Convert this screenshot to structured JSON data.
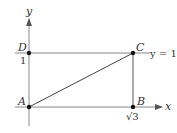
{
  "diagram": {
    "axes": {
      "x_label": "x",
      "y_label": "y"
    },
    "points": [
      {
        "id": "A",
        "label": "A",
        "coords": [
          0,
          0
        ]
      },
      {
        "id": "B",
        "label": "B",
        "coords": [
          1.732,
          0
        ]
      },
      {
        "id": "C",
        "label": "C",
        "coords": [
          1.732,
          1
        ]
      },
      {
        "id": "D",
        "label": "D",
        "coords": [
          0,
          1
        ]
      }
    ],
    "tick_labels": {
      "y_tick": "1",
      "x_tick": "√3"
    },
    "line_label": "y = 1",
    "segments": [
      "AC",
      "CB",
      "DC"
    ],
    "colors": {
      "axis": "#888888",
      "segment": "#444444",
      "point": "#111111",
      "text": "#333333"
    }
  }
}
